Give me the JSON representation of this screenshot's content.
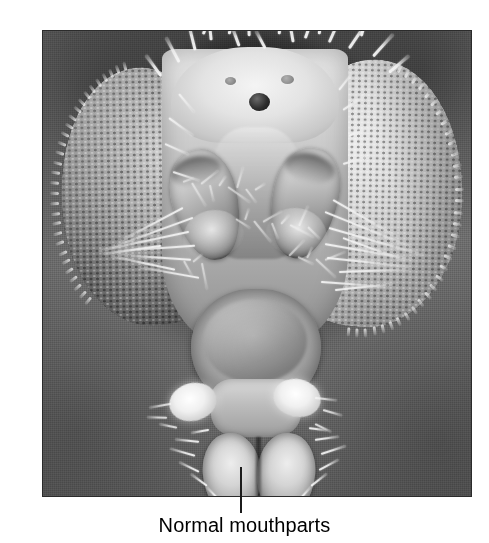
{
  "figure": {
    "type": "scanning-electron-micrograph",
    "caption": "Normal mouthparts",
    "leader_line": {
      "orientation": "vertical",
      "points_to": "labellum",
      "color": "#1b1b1b"
    },
    "page_background": "#ffffff",
    "plate_border_color": "#2b2b2b",
    "plate_background": "#6f6f6f"
  },
  "specimen": {
    "eye_left_label": "compound-eye-left",
    "eye_right_label": "compound-eye-right",
    "vertex_label": "vertex",
    "ocelli_label": "ocelli",
    "antenna_left_label": "antenna-left",
    "antenna_right_label": "antenna-right",
    "clypeus_label": "clypeus",
    "palp_left_label": "maxillary-palp-left",
    "palp_right_label": "maxillary-palp-right",
    "labellum_label": "labellum"
  }
}
